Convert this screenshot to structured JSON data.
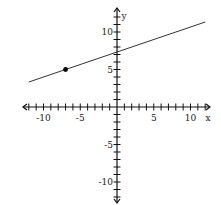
{
  "chart_data": {
    "type": "line",
    "title": "",
    "xlabel": "x",
    "ylabel": "y",
    "xlim": [
      -13,
      13
    ],
    "ylim": [
      -13,
      13
    ],
    "x_ticks": [
      -10,
      -5,
      5,
      10
    ],
    "y_ticks": [
      10,
      5,
      -5,
      -10
    ],
    "x_tick_labels": [
      "-10",
      "-5",
      "5",
      "10"
    ],
    "y_tick_labels": [
      "10",
      "5",
      "-5",
      "-10"
    ],
    "grid": false,
    "series": [
      {
        "name": "line",
        "slope": 0.3333,
        "intercept": 7.33,
        "x": [
          -12,
          12
        ],
        "y": [
          3.33,
          11.33
        ]
      }
    ],
    "points": [
      {
        "x": -7,
        "y": 5
      }
    ],
    "colors": {
      "axis": "#111111",
      "line": "#333333",
      "point": "#000000"
    }
  }
}
